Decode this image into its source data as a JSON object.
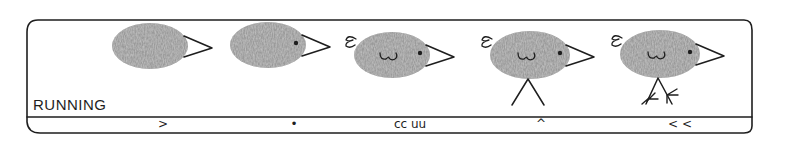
{
  "panel": {
    "label": "RUNNING",
    "colors": {
      "ink": "#1e1e1e",
      "thumbprint": "#9a9a9a",
      "background": "#ffffff"
    }
  },
  "steps": [
    {
      "index": 1,
      "description": "thumbprint body with beak",
      "features": [
        "body",
        "beak"
      ],
      "mark": ">"
    },
    {
      "index": 2,
      "description": "add eye",
      "features": [
        "body",
        "beak",
        "eye"
      ],
      "mark": "•"
    },
    {
      "index": 3,
      "description": "add tail curl and wing",
      "features": [
        "body",
        "beak",
        "eye",
        "tail",
        "wing"
      ],
      "mark": "cc uu"
    },
    {
      "index": 4,
      "description": "add legs",
      "features": [
        "body",
        "beak",
        "eye",
        "tail",
        "wing",
        "legs"
      ],
      "mark": "^"
    },
    {
      "index": 5,
      "description": "add feet (running)",
      "features": [
        "body",
        "beak",
        "eye",
        "tail",
        "wing",
        "legs",
        "feet"
      ],
      "mark": "< <"
    }
  ]
}
